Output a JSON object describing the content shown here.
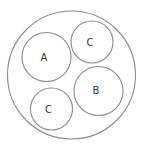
{
  "diagram": {
    "type": "nested-circles",
    "outer": {
      "cx": 71.5,
      "cy": 75,
      "r": 64
    },
    "circles": [
      {
        "label": "A",
        "cx": 46.5,
        "cy": 57,
        "r": 24.5
      },
      {
        "label": "C",
        "cx": 92,
        "cy": 42,
        "r": 21
      },
      {
        "label": "B",
        "cx": 98.5,
        "cy": 91,
        "r": 24.5
      },
      {
        "label": "C",
        "cx": 51.5,
        "cy": 109,
        "r": 21
      }
    ],
    "colors": {
      "stroke": "#8a8a8a",
      "text": "#333333",
      "background": "#ffffff"
    }
  }
}
